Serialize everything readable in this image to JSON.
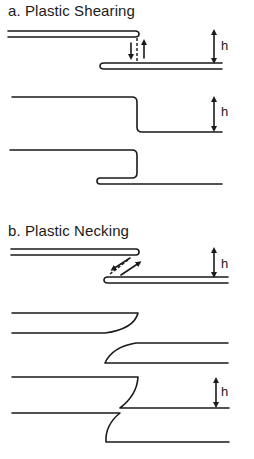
{
  "figure": {
    "panels": [
      {
        "id": "a",
        "title": "a.  Plastic Shearing",
        "stages": [
          {
            "description": "two overlapping plates with shear arrows",
            "dimension_label": "h"
          },
          {
            "description": "plate sheared into step",
            "dimension_label": "h"
          },
          {
            "description": "plate sheared and folded back"
          }
        ]
      },
      {
        "id": "b",
        "title": "b.  Plastic Necking",
        "stages": [
          {
            "description": "two overlapping plates with diagonal necking arrows",
            "dimension_label": "h"
          },
          {
            "description": "plates necked and separated with curved ends"
          },
          {
            "description": "necked plates offset",
            "dimension_label": "h"
          }
        ]
      }
    ],
    "colors": {
      "line": "#1a1a1a",
      "background": "#ffffff"
    }
  }
}
